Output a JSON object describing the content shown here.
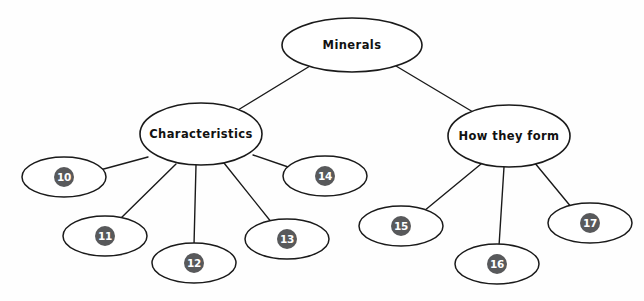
{
  "diagram": {
    "type": "concept-map",
    "background_color": "#fefefe",
    "stroke_color": "#1a1a1a",
    "badge_fill_color": "#58595b",
    "badge_text_color": "#ffffff",
    "root": {
      "id": "minerals",
      "label": "Minerals",
      "cx": 352,
      "cy": 45,
      "rx": 70,
      "ry": 27
    },
    "branches": [
      {
        "id": "characteristics",
        "label": "Characteristics",
        "cx": 201,
        "cy": 134,
        "rx": 61,
        "ry": 31
      },
      {
        "id": "how-they-form",
        "label": "How they form",
        "cx": 509,
        "cy": 136,
        "rx": 61,
        "ry": 31
      }
    ],
    "badges": [
      {
        "id": "badge-10",
        "label": "10",
        "parent": "characteristics",
        "cx": 64,
        "cy": 177,
        "rx": 42,
        "ry": 20,
        "disc_r": 10
      },
      {
        "id": "badge-11",
        "label": "11",
        "parent": "characteristics",
        "cx": 105,
        "cy": 236,
        "rx": 42,
        "ry": 20,
        "disc_r": 10
      },
      {
        "id": "badge-12",
        "label": "12",
        "parent": "characteristics",
        "cx": 194,
        "cy": 263,
        "rx": 42,
        "ry": 20,
        "disc_r": 10
      },
      {
        "id": "badge-13",
        "label": "13",
        "parent": "characteristics",
        "cx": 287,
        "cy": 239,
        "rx": 42,
        "ry": 20,
        "disc_r": 10
      },
      {
        "id": "badge-14",
        "label": "14",
        "parent": "characteristics",
        "cx": 325,
        "cy": 176,
        "rx": 42,
        "ry": 20,
        "disc_r": 10
      },
      {
        "id": "badge-15",
        "label": "15",
        "parent": "how-they-form",
        "cx": 401,
        "cy": 226,
        "rx": 42,
        "ry": 20,
        "disc_r": 10
      },
      {
        "id": "badge-16",
        "label": "16",
        "parent": "how-they-form",
        "cx": 497,
        "cy": 264,
        "rx": 42,
        "ry": 20,
        "disc_r": 10
      },
      {
        "id": "badge-17",
        "label": "17",
        "parent": "how-they-form",
        "cx": 590,
        "cy": 223,
        "rx": 42,
        "ry": 20,
        "disc_r": 10
      }
    ],
    "edges": [
      {
        "id": "edge-minerals-characteristics",
        "from": "minerals",
        "to": "characteristics",
        "x1": 310,
        "y1": 66,
        "x2": 238,
        "y2": 110
      },
      {
        "id": "edge-minerals-howtheyform",
        "from": "minerals",
        "to": "how-they-form",
        "x1": 396,
        "y1": 66,
        "x2": 473,
        "y2": 112
      },
      {
        "id": "edge-characteristics-10",
        "from": "characteristics",
        "to": "badge-10",
        "x1": 148,
        "y1": 157,
        "x2": 100,
        "y2": 170
      },
      {
        "id": "edge-characteristics-11",
        "from": "characteristics",
        "to": "badge-11",
        "x1": 176,
        "y1": 164,
        "x2": 119,
        "y2": 220
      },
      {
        "id": "edge-characteristics-12",
        "from": "characteristics",
        "to": "badge-12",
        "x1": 196,
        "y1": 165,
        "x2": 194,
        "y2": 245
      },
      {
        "id": "edge-characteristics-13",
        "from": "characteristics",
        "to": "badge-13",
        "x1": 224,
        "y1": 163,
        "x2": 272,
        "y2": 223
      },
      {
        "id": "edge-characteristics-14",
        "from": "characteristics",
        "to": "badge-14",
        "x1": 253,
        "y1": 155,
        "x2": 294,
        "y2": 169
      },
      {
        "id": "edge-howtheyform-15",
        "from": "how-they-form",
        "to": "badge-15",
        "x1": 481,
        "y1": 164,
        "x2": 424,
        "y2": 211
      },
      {
        "id": "edge-howtheyform-16",
        "from": "how-they-form",
        "to": "badge-16",
        "x1": 504,
        "y1": 167,
        "x2": 499,
        "y2": 246
      },
      {
        "id": "edge-howtheyform-17",
        "from": "how-they-form",
        "to": "badge-17",
        "x1": 534,
        "y1": 162,
        "x2": 572,
        "y2": 208
      }
    ]
  }
}
